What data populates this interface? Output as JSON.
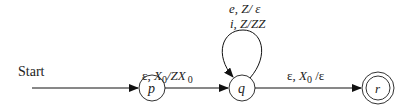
{
  "diagram": {
    "type": "pushdown-automaton",
    "start_label": "Start",
    "states": [
      {
        "id": "p",
        "label": "p",
        "accepting": false
      },
      {
        "id": "q",
        "label": "q",
        "accepting": false
      },
      {
        "id": "r",
        "label": "r",
        "accepting": true
      }
    ],
    "transitions": [
      {
        "from": "p",
        "to": "q",
        "label_parts": {
          "eps": "ε, ",
          "x": "X",
          "sub": "0",
          "mid": "/ZX",
          "sub2": "0"
        }
      },
      {
        "from": "q",
        "to": "q",
        "label_line1": "e, Z/ ε",
        "label_line2": "i, Z/ZZ"
      },
      {
        "from": "q",
        "to": "r",
        "label_parts": {
          "eps": "ε, ",
          "x": "X",
          "sub": "0",
          "tail": " /ε"
        }
      }
    ]
  }
}
